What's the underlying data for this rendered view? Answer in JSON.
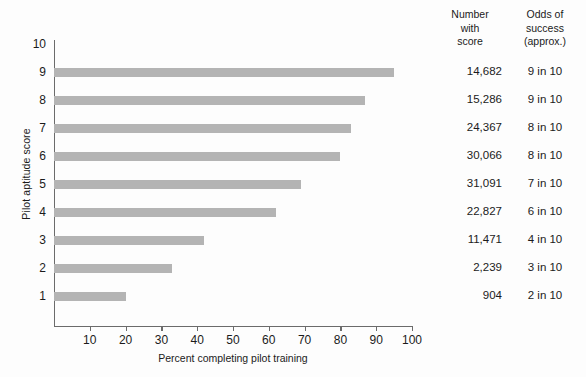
{
  "chart_data": {
    "type": "bar",
    "orientation": "horizontal",
    "title": "",
    "xlabel": "Percent completing pilot training",
    "ylabel": "Pilot aptitude score",
    "categories": [
      9,
      8,
      7,
      6,
      5,
      4,
      3,
      2,
      1
    ],
    "values": [
      95,
      87,
      83,
      80,
      69,
      62,
      42,
      33,
      20
    ],
    "xlim": [
      0,
      100
    ],
    "xticks": [
      10,
      20,
      30,
      40,
      50,
      60,
      70,
      80,
      90,
      100
    ],
    "yticks": [
      10,
      9,
      8,
      7,
      6,
      5,
      4,
      3,
      2,
      1
    ],
    "grid": false,
    "legend": false,
    "bar_color": "#b4b4b4",
    "axis_color": "#6b6b6b"
  },
  "table": {
    "headers": {
      "number": [
        "Number",
        "with",
        "score"
      ],
      "odds": [
        "Odds of",
        "success",
        "(approx.)"
      ]
    },
    "rows": [
      {
        "score": 9,
        "number": "14,682",
        "odds": "9 in 10"
      },
      {
        "score": 8,
        "number": "15,286",
        "odds": "9 in 10"
      },
      {
        "score": 7,
        "number": "24,367",
        "odds": "8 in 10"
      },
      {
        "score": 6,
        "number": "30,066",
        "odds": "8 in 10"
      },
      {
        "score": 5,
        "number": "31,091",
        "odds": "7 in 10"
      },
      {
        "score": 4,
        "number": "22,827",
        "odds": "6 in 10"
      },
      {
        "score": 3,
        "number": "11,471",
        "odds": "4 in 10"
      },
      {
        "score": 2,
        "number": "2,239",
        "odds": "3 in 10"
      },
      {
        "score": 1,
        "number": "904",
        "odds": "2 in 10"
      }
    ]
  }
}
